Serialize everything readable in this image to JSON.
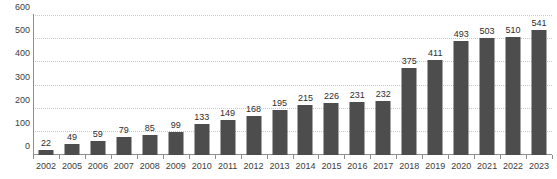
{
  "chart_data": {
    "type": "bar",
    "title": "",
    "subtitle": "",
    "xlabel": "",
    "ylabel": "",
    "categories": [
      "2002",
      "2005",
      "2006",
      "2007",
      "2008",
      "2009",
      "2010",
      "2011",
      "2012",
      "2013",
      "2014",
      "2015",
      "2016",
      "2017",
      "2018",
      "2019",
      "2020",
      "2021",
      "2022",
      "2023"
    ],
    "values": [
      22,
      49,
      59,
      79,
      85,
      99,
      133,
      149,
      168,
      195,
      215,
      226,
      231,
      232,
      375,
      411,
      493,
      503,
      510,
      541
    ],
    "data_labels": [
      "22",
      "49",
      "59",
      "79",
      "85",
      "99",
      "133",
      "149",
      "168",
      "195",
      "215",
      "226",
      "231",
      "232",
      "375",
      "411",
      "493",
      "503",
      "510",
      "541"
    ],
    "ylim": [
      0,
      600
    ],
    "ytick_values": [
      0,
      100,
      200,
      300,
      400,
      500,
      600
    ],
    "ytick_labels": [
      "0",
      "100",
      "200",
      "300",
      "400",
      "500",
      "600"
    ],
    "grid": true,
    "grid_axis": "y",
    "grid_style": "dotted",
    "legend": false,
    "legend_position": "none",
    "series": [
      {
        "name": "",
        "values": [
          22,
          49,
          59,
          79,
          85,
          99,
          133,
          149,
          168,
          195,
          215,
          226,
          231,
          232,
          375,
          411,
          493,
          503,
          510,
          541
        ]
      }
    ]
  },
  "style": {
    "bar_color": "#4d4d4d",
    "background_color": "#ffffff",
    "grid_color": "#c9c9c9",
    "axis_color": "#8f8f8f",
    "label_color": "#3d3d3d",
    "value_label_color": "#2e2e2e"
  }
}
